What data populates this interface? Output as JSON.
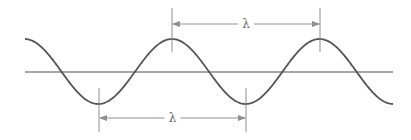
{
  "diagram": {
    "type": "wave-wavelength",
    "colors": {
      "wave": "#555555",
      "axis": "#8a8a8a",
      "dimension": "#8f8f8f",
      "label": "#6a6a6a",
      "background": "#ffffff"
    },
    "axis": {
      "y": 72,
      "x_start": 25,
      "x_end": 393
    },
    "wave": {
      "x_start": 25,
      "x_end": 393,
      "center_y": 71.5,
      "amplitude": 32.5,
      "period": 147.5,
      "first_peak_x": 172
    },
    "crest_dimension": {
      "label": "λ",
      "x1": 172,
      "x2": 320,
      "arrow_y": 24,
      "tick_top": 8,
      "tick_bottom": 52
    },
    "trough_dimension": {
      "label": "λ",
      "x1": 99,
      "x2": 246,
      "arrow_y": 118,
      "tick_top": 88,
      "tick_bottom": 132
    }
  }
}
